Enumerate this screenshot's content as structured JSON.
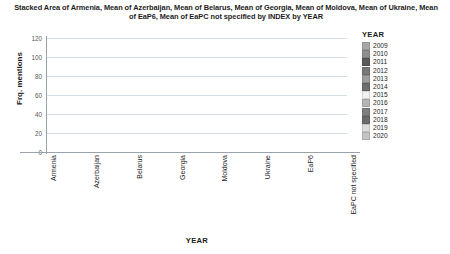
{
  "chart": {
    "title": "Stacked Area of Armenia, Mean of Azerbaijan, Mean of Belarus, Mean of Georgia, Mean of Moldova, Mean of Ukraine, Mean of EaP6, Mean of EaPC not specified by INDEX by YEAR",
    "ylabel": "Frq. mentions",
    "xaxis_title": "YEAR",
    "legend_title": "YEAR"
  },
  "chart_data": {
    "type": "area",
    "stacked": true,
    "title": "Stacked Area of Armenia, Mean of Azerbaijan, Mean of Belarus, Mean of Georgia, Mean of Moldova, Mean of Ukraine, Mean of EaP6, Mean of EaPC not specified by INDEX by YEAR",
    "xlabel": "YEAR",
    "ylabel": "Frq. mentions",
    "ylim": [
      0,
      120
    ],
    "yticks": [
      0,
      20,
      40,
      60,
      80,
      100,
      120
    ],
    "grid": true,
    "legend_position": "right",
    "categories": [
      "Armenia",
      "Azerbaijan",
      "Belarus",
      "Georgia",
      "Moldova",
      "Ukraine",
      "EaP6",
      "EaPC not specified"
    ],
    "series": [
      {
        "name": "2009",
        "color": "#a8a8a8",
        "values": [
          3.0,
          2.0,
          1.5,
          4.0,
          3.0,
          9.0,
          3.5,
          8.5
        ]
      },
      {
        "name": "2010",
        "color": "#8f8f8f",
        "values": [
          2.5,
          1.8,
          1.3,
          4.5,
          3.0,
          10.0,
          3.5,
          9.0
        ]
      },
      {
        "name": "2011",
        "color": "#5a5a5a",
        "values": [
          3.0,
          2.0,
          1.5,
          5.0,
          3.2,
          11.0,
          4.0,
          10.0
        ]
      },
      {
        "name": "2012",
        "color": "#787878",
        "values": [
          2.8,
          2.0,
          1.4,
          4.8,
          3.0,
          10.5,
          3.8,
          9.5
        ]
      },
      {
        "name": "2013",
        "color": "#9d9d9d",
        "values": [
          2.6,
          1.9,
          1.4,
          4.6,
          3.0,
          10.0,
          3.6,
          9.2
        ]
      },
      {
        "name": "2014",
        "color": "#6e6e6e",
        "values": [
          2.4,
          1.8,
          1.3,
          4.4,
          2.8,
          9.8,
          3.4,
          9.0
        ]
      },
      {
        "name": "2015",
        "color": "#f2f2f2",
        "values": [
          2.2,
          1.6,
          1.2,
          4.0,
          2.6,
          9.0,
          3.2,
          8.5
        ]
      },
      {
        "name": "2016",
        "color": "#b5b5b5",
        "values": [
          2.2,
          1.6,
          1.2,
          3.8,
          2.5,
          8.5,
          3.0,
          8.0
        ]
      },
      {
        "name": "2017",
        "color": "#7f7f7f",
        "values": [
          2.3,
          1.7,
          1.2,
          3.8,
          2.6,
          8.5,
          3.2,
          8.2
        ]
      },
      {
        "name": "2018",
        "color": "#6b6b6b",
        "values": [
          2.5,
          1.8,
          1.3,
          4.0,
          2.8,
          9.0,
          3.4,
          8.8
        ]
      },
      {
        "name": "2019",
        "color": "#dcdcdc",
        "values": [
          2.3,
          1.7,
          1.2,
          3.8,
          2.6,
          8.2,
          3.2,
          8.0
        ]
      },
      {
        "name": "2020",
        "color": "#c4c4c4",
        "values": [
          2.2,
          1.6,
          1.2,
          3.3,
          2.4,
          7.5,
          3.0,
          7.3
        ]
      }
    ],
    "totals": [
      30.0,
      21.5,
      15.7,
      50.0,
      33.5,
      111.0,
      40.8,
      104.0
    ]
  },
  "legend": {
    "title": "YEAR",
    "items": [
      {
        "label": "2009",
        "color": "#a8a8a8"
      },
      {
        "label": "2010",
        "color": "#8f8f8f"
      },
      {
        "label": "2011",
        "color": "#5a5a5a"
      },
      {
        "label": "2012",
        "color": "#787878"
      },
      {
        "label": "2013",
        "color": "#9d9d9d"
      },
      {
        "label": "2014",
        "color": "#6e6e6e"
      },
      {
        "label": "2015",
        "color": "#f2f2f2"
      },
      {
        "label": "2016",
        "color": "#b5b5b5"
      },
      {
        "label": "2017",
        "color": "#7f7f7f"
      },
      {
        "label": "2018",
        "color": "#6b6b6b"
      },
      {
        "label": "2019",
        "color": "#dcdcdc"
      },
      {
        "label": "2020",
        "color": "#c4c4c4"
      }
    ]
  }
}
